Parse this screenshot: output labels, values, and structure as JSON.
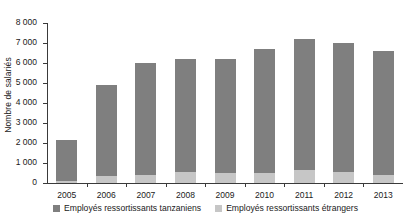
{
  "chart_data": {
    "type": "bar",
    "stacked": true,
    "title": "",
    "xlabel": "",
    "ylabel": "Nombre de salariés",
    "ylim": [
      0,
      8000
    ],
    "ytick_step": 1000,
    "grid": false,
    "legend_position": "bottom",
    "categories": [
      "2005",
      "2006",
      "2007",
      "2008",
      "2009",
      "2010",
      "2011",
      "2012",
      "2013"
    ],
    "ytick_labels": [
      "0",
      "1 000",
      "2 000",
      "3 000",
      "4 000",
      "5 000",
      "6 000",
      "7 000",
      "8 000"
    ],
    "ytick_values": [
      0,
      1000,
      2000,
      3000,
      4000,
      5000,
      6000,
      7000,
      8000
    ],
    "series": [
      {
        "name": "Employés ressortissants étrangers",
        "color": "#c6c6c6",
        "values": [
          100,
          350,
          420,
          540,
          480,
          520,
          640,
          560,
          420
        ]
      },
      {
        "name": "Employés ressortissants tanzaniens",
        "color": "#7f7f7f",
        "values": [
          2050,
          4550,
          5580,
          5660,
          5720,
          6180,
          6560,
          6440,
          6180
        ]
      }
    ],
    "totals": [
      2150,
      4900,
      6000,
      6200,
      6200,
      6700,
      7200,
      7000,
      6600
    ]
  },
  "legend": {
    "items": [
      {
        "label": "Employés ressortissants tanzaniens",
        "color": "#7f7f7f"
      },
      {
        "label": "Employés ressortissants étrangers",
        "color": "#c6c6c6"
      }
    ]
  }
}
